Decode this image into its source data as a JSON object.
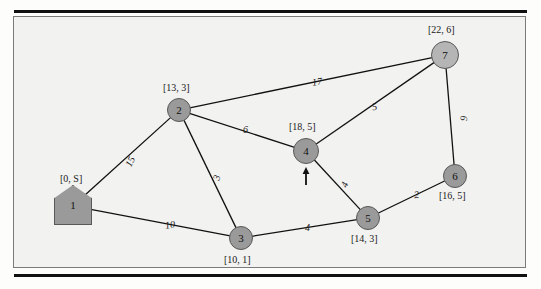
{
  "figure": {
    "kind": "weighted-undirected-graph",
    "background_color": "#f2f2f0",
    "node_fill": "#999999",
    "node_fill_light": "#b5b5b5",
    "node_stroke": "#595959",
    "edge_color": "#111111"
  },
  "nodes": [
    {
      "id": "1",
      "label": "1",
      "bracket": "[0, S]",
      "shape": "pentagon",
      "x": 73,
      "y": 206,
      "r": 15,
      "label_dx": -13,
      "label_dy": -33,
      "fill": "#9a9a9a"
    },
    {
      "id": "2",
      "label": "2",
      "bracket": "[13, 3]",
      "shape": "circle",
      "x": 179,
      "y": 110,
      "r": 12,
      "label_dx": -16,
      "label_dy": -28,
      "fill": "#9a9a9a"
    },
    {
      "id": "3",
      "label": "3",
      "bracket": "[10, 1]",
      "shape": "circle",
      "x": 241,
      "y": 238,
      "r": 12,
      "label_dx": -17,
      "label_dy": 16,
      "fill": "#9a9a9a"
    },
    {
      "id": "4",
      "label": "4",
      "bracket": "[18, 5]",
      "shape": "circle",
      "x": 306,
      "y": 151,
      "r": 13,
      "label_dx": -17,
      "label_dy": -30,
      "fill": "#9a9a9a"
    },
    {
      "id": "5",
      "label": "5",
      "bracket": "[14, 3]",
      "shape": "circle",
      "x": 368,
      "y": 218,
      "r": 12,
      "label_dx": -17,
      "label_dy": 15,
      "fill": "#9a9a9a"
    },
    {
      "id": "6",
      "label": "6",
      "bracket": "[16, 5]",
      "shape": "circle",
      "x": 455,
      "y": 176,
      "r": 12,
      "label_dx": -16,
      "label_dy": 14,
      "fill": "#9a9a9a"
    },
    {
      "id": "7",
      "label": "7",
      "bracket": "[22, 6]",
      "shape": "circle",
      "x": 445,
      "y": 55,
      "r": 14,
      "label_dx": -17,
      "label_dy": -31,
      "fill": "#b5b5b5"
    }
  ],
  "edges": [
    {
      "from": "1",
      "to": "2",
      "weight": "15",
      "lx": 125,
      "ly": 156,
      "rot": -65
    },
    {
      "from": "1",
      "to": "3",
      "weight": "10",
      "lx": 165,
      "ly": 219,
      "rot": -8
    },
    {
      "from": "2",
      "to": "3",
      "weight": "3",
      "lx": 214,
      "ly": 172,
      "rot": -72
    },
    {
      "from": "2",
      "to": "4",
      "weight": "6",
      "lx": 243,
      "ly": 124,
      "rot": 0
    },
    {
      "from": "2",
      "to": "7",
      "weight": "17",
      "lx": 312,
      "ly": 76,
      "rot": -8
    },
    {
      "from": "3",
      "to": "5",
      "weight": "4",
      "lx": 305,
      "ly": 222,
      "rot": 0
    },
    {
      "from": "4",
      "to": "5",
      "weight": "4",
      "lx": 342,
      "ly": 179,
      "rot": -68
    },
    {
      "from": "4",
      "to": "7",
      "weight": "5",
      "lx": 372,
      "ly": 101,
      "rot": -12
    },
    {
      "from": "5",
      "to": "6",
      "weight": "2",
      "lx": 414,
      "ly": 189,
      "rot": -7
    },
    {
      "from": "6",
      "to": "7",
      "weight": "9",
      "lx": 461,
      "ly": 113,
      "rot": -88
    }
  ],
  "annotations": [
    {
      "name": "current-node-arrow",
      "target": "4",
      "x": 306,
      "y": 185,
      "direction": "up"
    }
  ]
}
